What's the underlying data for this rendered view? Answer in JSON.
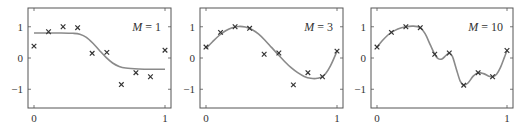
{
  "chart_data": [
    {
      "type": "line",
      "title": "M = 1",
      "label_var": "M",
      "label_val": "1",
      "xlabel": "",
      "ylabel": "",
      "xlim": [
        0,
        1
      ],
      "ylim": [
        -1.6,
        1.6
      ],
      "xticks": [
        "0",
        "1"
      ],
      "yticks": [
        "1",
        "0",
        "−1"
      ],
      "grid": false,
      "frame": {
        "x0": 28,
        "x1": 171,
        "y0": 8,
        "y1": 108
      },
      "points": [
        [
          0,
          0.38
        ],
        [
          0.111,
          0.84
        ],
        [
          0.222,
          1.0
        ],
        [
          0.333,
          0.97
        ],
        [
          0.444,
          0.15
        ],
        [
          0.556,
          0.18
        ],
        [
          0.667,
          -0.85
        ],
        [
          0.778,
          -0.47
        ],
        [
          0.889,
          -0.6
        ],
        [
          1.0,
          0.25
        ]
      ],
      "curve": [
        [
          0,
          0.8
        ],
        [
          0.1,
          0.8
        ],
        [
          0.2,
          0.8
        ],
        [
          0.3,
          0.79
        ],
        [
          0.35,
          0.76
        ],
        [
          0.4,
          0.66
        ],
        [
          0.45,
          0.47
        ],
        [
          0.5,
          0.24
        ],
        [
          0.55,
          0.02
        ],
        [
          0.6,
          -0.16
        ],
        [
          0.65,
          -0.27
        ],
        [
          0.7,
          -0.32
        ],
        [
          0.8,
          -0.35
        ],
        [
          0.9,
          -0.36
        ],
        [
          1.0,
          -0.36
        ]
      ]
    },
    {
      "type": "line",
      "title": "M = 3",
      "label_var": "M",
      "label_val": "3",
      "xlabel": "",
      "ylabel": "",
      "xlim": [
        0,
        1
      ],
      "ylim": [
        -1.6,
        1.6
      ],
      "xticks": [
        "0",
        "1"
      ],
      "yticks": [
        "1",
        "0",
        "−1"
      ],
      "grid": false,
      "frame": {
        "x0": 200,
        "x1": 343,
        "y0": 8,
        "y1": 108
      },
      "points": [
        [
          0,
          0.35
        ],
        [
          0.111,
          0.82
        ],
        [
          0.222,
          1.0
        ],
        [
          0.333,
          0.95
        ],
        [
          0.444,
          0.12
        ],
        [
          0.556,
          0.16
        ],
        [
          0.667,
          -0.86
        ],
        [
          0.778,
          -0.47
        ],
        [
          0.889,
          -0.6
        ],
        [
          1.0,
          0.22
        ]
      ],
      "curve": [
        [
          0,
          0.3
        ],
        [
          0.05,
          0.52
        ],
        [
          0.1,
          0.72
        ],
        [
          0.15,
          0.87
        ],
        [
          0.2,
          0.97
        ],
        [
          0.25,
          1.01
        ],
        [
          0.3,
          0.99
        ],
        [
          0.35,
          0.91
        ],
        [
          0.4,
          0.77
        ],
        [
          0.45,
          0.57
        ],
        [
          0.5,
          0.34
        ],
        [
          0.55,
          0.11
        ],
        [
          0.6,
          -0.11
        ],
        [
          0.65,
          -0.31
        ],
        [
          0.7,
          -0.47
        ],
        [
          0.75,
          -0.59
        ],
        [
          0.8,
          -0.65
        ],
        [
          0.85,
          -0.65
        ],
        [
          0.9,
          -0.56
        ],
        [
          0.95,
          -0.25
        ],
        [
          1.0,
          0.22
        ]
      ]
    },
    {
      "type": "line",
      "title": "M = 10",
      "label_var": "M",
      "label_val": "10",
      "xlabel": "",
      "ylabel": "",
      "xlim": [
        0,
        1
      ],
      "ylim": [
        -1.6,
        1.6
      ],
      "xticks": [
        "0",
        "1"
      ],
      "yticks": [
        "1",
        "0",
        "−1"
      ],
      "grid": false,
      "frame": {
        "x0": 371,
        "x1": 513,
        "y0": 8,
        "y1": 108
      },
      "points": [
        [
          0,
          0.35
        ],
        [
          0.111,
          0.82
        ],
        [
          0.222,
          1.0
        ],
        [
          0.333,
          0.97
        ],
        [
          0.444,
          0.12
        ],
        [
          0.556,
          0.16
        ],
        [
          0.667,
          -0.87
        ],
        [
          0.778,
          -0.47
        ],
        [
          0.889,
          -0.6
        ],
        [
          1.0,
          0.24
        ]
      ],
      "curve": [
        [
          0,
          0.35
        ],
        [
          0.04,
          0.55
        ],
        [
          0.08,
          0.72
        ],
        [
          0.111,
          0.82
        ],
        [
          0.16,
          0.93
        ],
        [
          0.222,
          1.0
        ],
        [
          0.28,
          1.02
        ],
        [
          0.333,
          0.97
        ],
        [
          0.37,
          0.78
        ],
        [
          0.41,
          0.42
        ],
        [
          0.444,
          0.12
        ],
        [
          0.47,
          -0.02
        ],
        [
          0.5,
          -0.03
        ],
        [
          0.53,
          0.08
        ],
        [
          0.556,
          0.16
        ],
        [
          0.58,
          0.05
        ],
        [
          0.61,
          -0.35
        ],
        [
          0.64,
          -0.74
        ],
        [
          0.667,
          -0.87
        ],
        [
          0.7,
          -0.8
        ],
        [
          0.74,
          -0.58
        ],
        [
          0.778,
          -0.47
        ],
        [
          0.82,
          -0.5
        ],
        [
          0.86,
          -0.58
        ],
        [
          0.889,
          -0.6
        ],
        [
          0.92,
          -0.52
        ],
        [
          0.95,
          -0.3
        ],
        [
          0.98,
          0.02
        ],
        [
          1.0,
          0.24
        ]
      ]
    }
  ],
  "colors": {
    "frame": "#555555",
    "curve": "#8a8a8a",
    "marker": "#333333",
    "text": "#333333"
  }
}
